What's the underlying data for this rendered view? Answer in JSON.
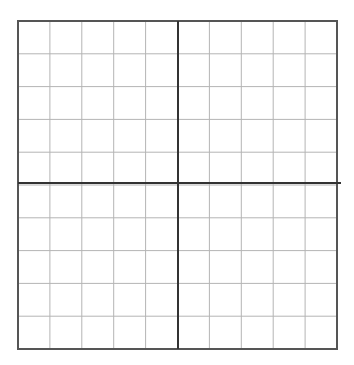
{
  "diagram": {
    "type": "coordinate-grid",
    "rows": 10,
    "cols": 10,
    "box": {
      "x": 18,
      "y": 21,
      "width": 319,
      "height": 328
    },
    "axis_x_position": 183,
    "axis_y_position": 178,
    "axis_x_extends_to": 341,
    "colors": {
      "background": "#ffffff",
      "grid_line": "#b4b4b4",
      "border": "#555555",
      "axis": "#333333"
    }
  }
}
